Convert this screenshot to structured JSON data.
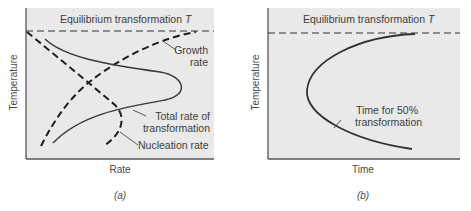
{
  "panels": [
    {
      "id": "a",
      "caption": "(a)",
      "equilibrium_label": "Equilibrium transformation ",
      "equilibrium_symbol": "T",
      "xlabel": "Rate",
      "ylabel": "Temperature",
      "curves": {
        "growth": {
          "label_line1": "Growth",
          "label_line2": "rate"
        },
        "total": {
          "label_line1": "Total rate of",
          "label_line2": "transformation"
        },
        "nucleation": {
          "label": "Nucleation rate"
        }
      }
    },
    {
      "id": "b",
      "caption": "(b)",
      "equilibrium_label": "Equilibrium transformation ",
      "equilibrium_symbol": "T",
      "xlabel": "Time",
      "ylabel": "Temperature",
      "curves": {
        "time50": {
          "label_line1": "Time for 50%",
          "label_line2": "transformation"
        }
      }
    }
  ],
  "colors": {
    "panel_bg": "#e9e9e9",
    "axis": "#555555",
    "curve": "#333333",
    "dashed": "#1e1e1e"
  }
}
